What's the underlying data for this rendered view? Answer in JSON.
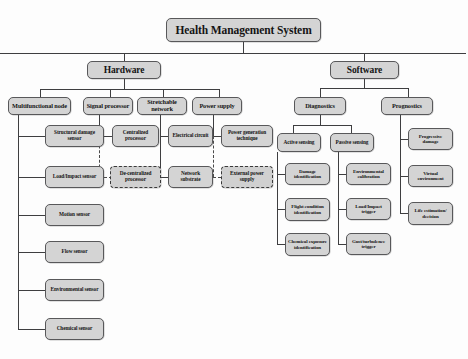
{
  "diagram": {
    "title": "Health Management System",
    "root": {
      "label": "Health Management System"
    },
    "level1": {
      "hardware": "Hardware",
      "software": "Software"
    },
    "level2": {
      "multifunctional_node": "Multifunctional node",
      "signal_processor": "Signal processor",
      "stretchable_network": "Stretchable network",
      "power_supply": "Power supply",
      "diagnostics": "Diagnostics",
      "prognostics": "Prognostics"
    },
    "level3": {
      "structural_damage_sensor": "Structural damage sensor",
      "centralized_processor": "Centralized processor",
      "electrical_circuit": "Electrical circuit",
      "power_generation_technique": "Power generation technique",
      "active_sensing": "Active sensing",
      "passive_sensing": "Passive sensing",
      "progressive_damage": "Progressive damage"
    },
    "multifunctional_node_children": [
      "Structural damage sensor",
      "Load/Impact sensor",
      "Motion sensor",
      "Flow sensor",
      "Environmental sensor",
      "Chemical sensor"
    ],
    "signal_processor_children": [
      {
        "label": "Centralized processor",
        "style": "solid"
      },
      {
        "label": "De-centralized processor",
        "style": "dashed"
      }
    ],
    "stretchable_network_children": [
      {
        "label": "Electrical circuit",
        "style": "solid"
      },
      {
        "label": "Network substrate",
        "style": "solid"
      }
    ],
    "power_supply_children": [
      {
        "label": "Power generation technique",
        "style": "solid"
      },
      {
        "label": "External power supply",
        "style": "dashed"
      }
    ],
    "active_sensing_children": [
      "Damage identification",
      "Flight condition identification",
      "Chemical exposure identification"
    ],
    "passive_sensing_children": [
      "Environmental calibration",
      "Load/Impact trigger",
      "Gust/turbulence trigger"
    ],
    "prognostics_children": [
      "Progressive damage",
      "Virtual environment",
      "Life estimation/ decision"
    ],
    "colors": {
      "box_fill": "#d4d4d4",
      "box_border": "#58585a",
      "line": "#3e3e40",
      "text": "#141414",
      "background": "#fdfdfd"
    }
  }
}
